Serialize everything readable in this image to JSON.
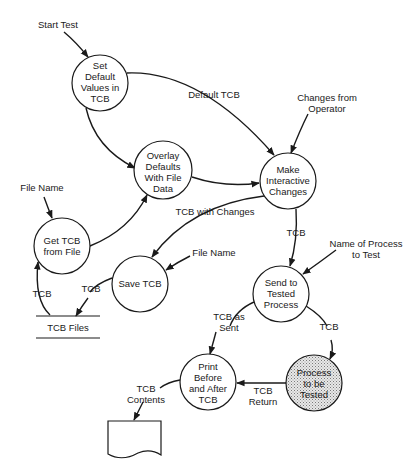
{
  "diagram": {
    "type": "data-flow-diagram",
    "processes": [
      {
        "id": "set_default",
        "lines": [
          "Set",
          "Default",
          "Values in",
          "TCB"
        ],
        "cx": 100,
        "cy": 83,
        "shaded": false
      },
      {
        "id": "overlay",
        "lines": [
          "Overlay",
          "Defaults",
          "With File",
          "Data"
        ],
        "cx": 163,
        "cy": 170,
        "shaded": false
      },
      {
        "id": "make_interactive",
        "lines": [
          "Make",
          "Interactive",
          "Changes"
        ],
        "cx": 288,
        "cy": 181,
        "shaded": false
      },
      {
        "id": "get_tcb",
        "lines": [
          "Get TCB",
          "from File"
        ],
        "cx": 62,
        "cy": 246,
        "shaded": false
      },
      {
        "id": "save_tcb",
        "lines": [
          "Save TCB"
        ],
        "cx": 140,
        "cy": 284,
        "shaded": false
      },
      {
        "id": "send_tested",
        "lines": [
          "Send to",
          "Tested",
          "Process"
        ],
        "cx": 281,
        "cy": 294,
        "shaded": false
      },
      {
        "id": "print",
        "lines": [
          "Print",
          "Before",
          "and After",
          "TCB"
        ],
        "cx": 208,
        "cy": 382,
        "shaded": false
      },
      {
        "id": "process_tested",
        "lines": [
          "Process",
          "to be",
          "Tested"
        ],
        "cx": 314,
        "cy": 383,
        "shaded": true
      }
    ],
    "labels": {
      "start_test": "Start Test",
      "default_tcb": "Default TCB",
      "changes_from_operator_1": "Changes from",
      "changes_from_operator_2": "Operator",
      "file_name_left": "File Name",
      "tcb_with_changes": "TCB with Changes",
      "file_name_save": "File Name",
      "tcb_down": "TCB",
      "name_of_process_1": "Name of Process",
      "name_of_process_2": "to Test",
      "tcb_store_up": "TCB",
      "tcb_store_down": "TCB",
      "tcb_files": "TCB Files",
      "tcb_as_sent_1": "TCB as",
      "tcb_as_sent_2": "Sent",
      "tcb_to_process": "TCB",
      "tcb_return_1": "TCB",
      "tcb_return_2": "Return",
      "tcb_contents_1": "TCB",
      "tcb_contents_2": "Contents"
    },
    "data_store": {
      "name": "TCB Files"
    },
    "output_document": {
      "name": "printout"
    }
  }
}
